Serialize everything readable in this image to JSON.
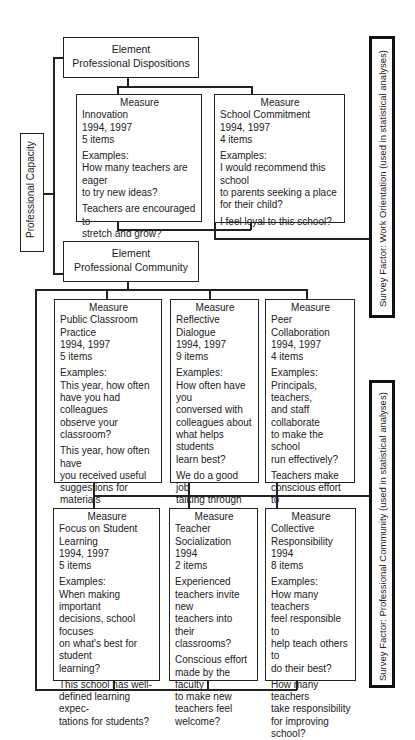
{
  "capacity_label": "Professional Capacity",
  "elements": [
    {
      "heading": "Element",
      "name": "Professional Dispositions"
    },
    {
      "heading": "Element",
      "name": "Professional Community"
    }
  ],
  "survey_factors": [
    "Survey Factor:  Work Orientation (used in statistical analyses)",
    "Survey Factor:  Professional Community (used in statistical analyses)"
  ],
  "measures": [
    {
      "heading": "Measure",
      "name": [
        "Innovation"
      ],
      "years": "1994, 1997",
      "items": "5 items",
      "examples_label": "Examples:",
      "examples": [
        [
          "How many teachers are eager",
          "to try new ideas?"
        ],
        [
          "Teachers are encouraged to",
          "stretch and grow?"
        ]
      ]
    },
    {
      "heading": "Measure",
      "name": [
        "School Commitment"
      ],
      "years": "1994, 1997",
      "items": "4 items",
      "examples_label": "Examples:",
      "examples": [
        [
          "I would recommend this school",
          "to parents seeking a place",
          "for their child?"
        ],
        [
          "I feel loyal to this school?"
        ]
      ]
    },
    {
      "heading": "Measure",
      "name": [
        "Public Classroom",
        "Practice"
      ],
      "years": "1994, 1997",
      "items": "5 items",
      "examples_label": "Examples:",
      "examples": [
        [
          "This year, how often",
          "have you had colleagues",
          "observe your classroom?"
        ],
        [
          "This year, how often have",
          "you received useful",
          "suggestions for materials",
          "from colleagues?"
        ]
      ]
    },
    {
      "heading": "Measure",
      "name": [
        "Reflective Dialogue"
      ],
      "years": "1994, 1997",
      "items": "9 items",
      "examples_label": "Examples:",
      "examples": [
        [
          "How often have you",
          "conversed with",
          "colleagues about",
          "what helps students",
          "learn best?"
        ],
        [
          "We do a good job",
          "talking through",
          "views, opinions,",
          "and values?"
        ]
      ]
    },
    {
      "heading": "Measure",
      "name": [
        "Peer Collaboration"
      ],
      "years": "1994, 1997",
      "items": "4 items",
      "examples_label": "Examples:",
      "examples": [
        [
          "Principals, teachers,",
          "and staff collaborate",
          "to make the school",
          "run effectively?"
        ],
        [
          "Teachers make",
          "conscious effort to",
          "coordinate teaching",
          "with other grade",
          "levels?"
        ]
      ]
    },
    {
      "heading": "Measure",
      "name": [
        "Focus on Student",
        "Learning"
      ],
      "years": "1994, 1997",
      "items": "5 items",
      "examples_label": "Examples:",
      "examples": [
        [
          "When making important",
          "decisions, school focuses",
          "on what's best for student",
          "learning?"
        ],
        [
          "This school has well-",
          "defined learning expec-",
          "tations for students?"
        ]
      ]
    },
    {
      "heading": "Measure",
      "name": [
        "Teacher Socialization"
      ],
      "years": "1994",
      "items": "2 items",
      "examples_label": "",
      "examples": [
        [
          "Experienced",
          "teachers invite new",
          "teachers into their",
          "classrooms?"
        ],
        [
          "Conscious effort",
          "made by the faculty",
          "to make new",
          "teachers feel",
          "welcome?"
        ]
      ]
    },
    {
      "heading": "Measure",
      "name": [
        "Collective",
        "Responsibility"
      ],
      "years": "1994",
      "items": "8 items",
      "examples_label": "Examples:",
      "examples": [
        [
          "How many teachers",
          "feel responsible to",
          "help teach others to",
          "do their best?"
        ],
        [
          "How many teachers",
          "take responsibility",
          "for improving school?"
        ]
      ]
    }
  ]
}
